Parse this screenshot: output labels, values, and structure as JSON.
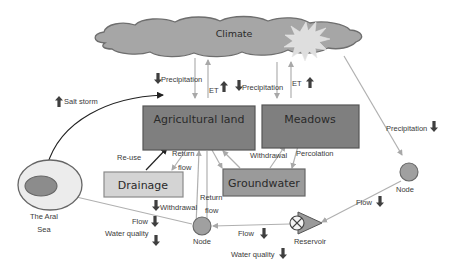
{
  "colors": {
    "cloud_fill": "#a6a6a6",
    "cloud_stroke": "#6e6e6e",
    "sun_fill": "#dedede",
    "box_dark_fill": "#7f7f7f",
    "box_dark_stroke": "#555555",
    "box_mid_fill": "#9a9a9a",
    "box_light_fill": "#d4d4d4",
    "box_light_stroke": "#8a8a8a",
    "flow_line": "#b0b0b0",
    "black_arrow": "#222222",
    "indicator_arrow": "#3f3f3f",
    "sea_outer_fill": "#ececec",
    "sea_inner_fill": "#8c8c8c",
    "node_fill": "#a0a0a0"
  },
  "nodes": {
    "climate": {
      "label": "Climate"
    },
    "agricultural_land": {
      "label": "Agricultural land"
    },
    "meadows": {
      "label": "Meadows"
    },
    "drainage": {
      "label": "Drainage"
    },
    "groundwater": {
      "label": "Groundwater"
    },
    "aral_sea": {
      "label_line1": "The Aral",
      "label_line2": "Sea"
    },
    "node_left": {
      "label": "Node"
    },
    "node_right": {
      "label": "Node"
    },
    "reservoir": {
      "label": "Reservoir"
    }
  },
  "flows": {
    "precip_agri": {
      "label": "Precipitation",
      "trend": "down"
    },
    "et_agri": {
      "label": "ET",
      "trend": "up"
    },
    "precip_meadows": {
      "label": "Precipitation",
      "trend": "down"
    },
    "et_meadows": {
      "label": "ET",
      "trend": "up"
    },
    "precip_node": {
      "label": "Precipitation",
      "trend": "down"
    },
    "salt_storm": {
      "label": "Salt storm",
      "trend": "up"
    },
    "re_use": {
      "label": "Re-use"
    },
    "return_flow_drainage": {
      "label_line1": "Return",
      "label_line2": "flow"
    },
    "return_flow_node": {
      "label_line1": "Return",
      "label_line2": "flow"
    },
    "withdrawal_gw": {
      "label": "Withdrawal"
    },
    "percolation": {
      "label": "Percolation"
    },
    "withdrawal_node": {
      "label": "Withdrawal",
      "trend": "down"
    },
    "flow_left": {
      "label": "Flow",
      "trend": "down"
    },
    "water_quality_left": {
      "label": "Water quality",
      "trend": "down"
    },
    "flow_mid": {
      "label": "Flow",
      "trend": "down"
    },
    "water_quality_mid": {
      "label": "Water quality",
      "trend": "down"
    },
    "flow_right": {
      "label": "Flow",
      "trend": "down"
    }
  }
}
